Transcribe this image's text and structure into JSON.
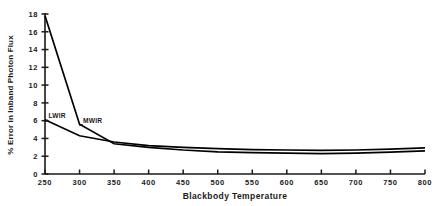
{
  "chart_data": {
    "type": "line",
    "title": "",
    "xlabel": "Blackbody Temperature",
    "ylabel": "% Error in Inband Photon Flux",
    "x": [
      250,
      300,
      350,
      400,
      450,
      500,
      550,
      600,
      650,
      700,
      750,
      800
    ],
    "xlim": [
      250,
      800
    ],
    "ylim": [
      0,
      18
    ],
    "xticks": [
      250,
      300,
      350,
      400,
      450,
      500,
      550,
      600,
      650,
      700,
      750,
      800
    ],
    "yticks": [
      0,
      2,
      4,
      6,
      8,
      10,
      12,
      14,
      16,
      18
    ],
    "grid": false,
    "legend_position": "inline-annotation",
    "series": [
      {
        "name": "MWIR",
        "label": "MWIR",
        "color": "#000000",
        "values": [
          17.8,
          5.6,
          3.4,
          3.0,
          2.7,
          2.5,
          2.4,
          2.35,
          2.3,
          2.35,
          2.45,
          2.6
        ],
        "annotation_x": 300,
        "annotation_y": 5.6
      },
      {
        "name": "LWIR",
        "label": "LWIR",
        "color": "#000000",
        "values": [
          6.1,
          4.3,
          3.6,
          3.2,
          3.0,
          2.85,
          2.75,
          2.7,
          2.65,
          2.7,
          2.8,
          2.95
        ],
        "annotation_x": 250,
        "annotation_y": 6.1
      }
    ]
  },
  "axes": {
    "x_tick_labels": [
      "250",
      "300",
      "350",
      "400",
      "450",
      "500",
      "550",
      "600",
      "650",
      "700",
      "750",
      "800"
    ],
    "y_tick_labels": [
      "0",
      "2",
      "4",
      "6",
      "8",
      "10",
      "12",
      "14",
      "16",
      "18"
    ],
    "x_axis_title": "Blackbody Temperature",
    "y_axis_title": "% Error in Inband Photon Flux"
  },
  "annotations": {
    "lwir": "LWIR",
    "mwir": "MWIR"
  },
  "colors": {
    "line": "#000000",
    "axis": "#1a1a1a",
    "text": "#1a1a1a",
    "background": "#ffffff"
  }
}
